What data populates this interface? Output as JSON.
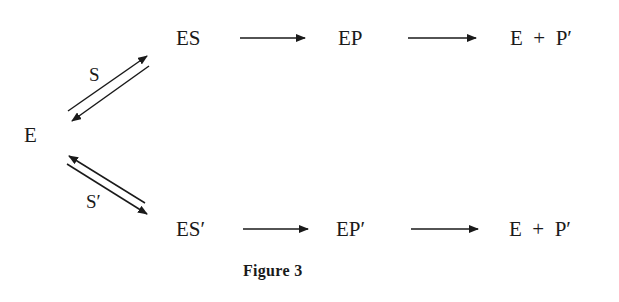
{
  "diagram": {
    "enzyme": "E",
    "upper_branch": {
      "substrate_label": "S",
      "complex": "ES",
      "product_complex": "EP",
      "products": {
        "enzyme": "E",
        "plus": "+",
        "product": "P′"
      }
    },
    "lower_branch": {
      "substrate_label": "S′",
      "complex": "ES′",
      "product_complex": "EP′",
      "products": {
        "enzyme": "E",
        "plus": "+",
        "product": "P′"
      }
    },
    "caption": "Figure 3",
    "colors": {
      "ink": "#1a1a1a",
      "background": "#ffffff"
    }
  }
}
